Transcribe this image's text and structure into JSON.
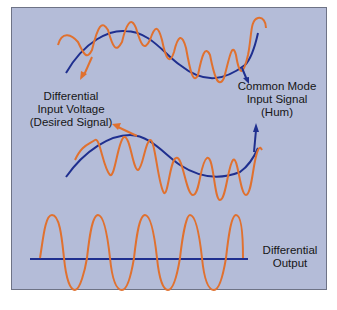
{
  "colors": {
    "background": "#b4bcd8",
    "border": "#6e7386",
    "desired_signal": "#e0712f",
    "common_mode": "#1f2f8f",
    "text": "#161616"
  },
  "labels": {
    "differential_input": [
      "Differential",
      "Input Voltage",
      "(Desired Signal)"
    ],
    "common_mode_input": [
      "Common Mode",
      "Input Signal",
      "(Hum)"
    ],
    "differential_output": [
      "Differential",
      "Output"
    ]
  }
}
